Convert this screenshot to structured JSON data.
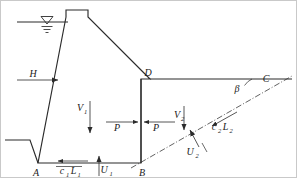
{
  "figure": {
    "colors": {
      "line": "#2b2b2b",
      "dashdot": "#3a3a3a",
      "frame": "#c9c9c9",
      "background": "#ffffff",
      "text": "#1a1a1a"
    }
  },
  "points": {
    "A": {
      "label": "A",
      "x": 38,
      "y": 163
    },
    "B": {
      "label": "B",
      "x": 141,
      "y": 163
    },
    "C": {
      "label": "C",
      "x": 264,
      "y": 80
    },
    "D": {
      "label": "D",
      "x": 150,
      "y": 79
    }
  },
  "labels": {
    "H": {
      "text": "H",
      "sub": "",
      "x": 33,
      "y": 77,
      "desc": "reservoir head"
    },
    "V1": {
      "text": "V",
      "sub": "1",
      "x": 83,
      "y": 109,
      "desc": "vertical weight of dam block"
    },
    "P_left": {
      "text": "P",
      "sub": "",
      "x": 118,
      "y": 125,
      "desc": "horizontal thrust acting right"
    },
    "P_right": {
      "text": "P",
      "sub": "",
      "x": 151,
      "y": 125,
      "desc": "horizontal thrust acting left"
    },
    "V2": {
      "text": "V",
      "sub": "2",
      "x": 182,
      "y": 117,
      "desc": "vertical weight of wedge"
    },
    "U1": {
      "text": "U",
      "sub": "1",
      "x": 102,
      "y": 172,
      "desc": "uplift on base AB"
    },
    "U2": {
      "text": "U",
      "sub": "2",
      "x": 193,
      "y": 152,
      "desc": "uplift on failure plane BC"
    },
    "c1L1": {
      "text": "c",
      "sub": "1L1",
      "full": "c1L1",
      "x": 66,
      "y": 172,
      "desc": "cohesion resistance along base"
    },
    "c2L2": {
      "text": "c",
      "sub": "2L2",
      "full": "c2L2",
      "x": 219,
      "y": 126,
      "desc": "cohesion resistance along failure plane"
    },
    "beta": {
      "text": "β",
      "sub": "",
      "x": 234,
      "y": 92,
      "desc": "inclination angle of failure plane"
    }
  },
  "symbols": {
    "water_table": {
      "name": "water-table-symbol",
      "x": 47,
      "y": 18
    }
  }
}
